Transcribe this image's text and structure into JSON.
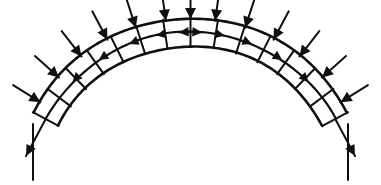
{
  "figure": {
    "title": "Masonry arch with radial loading and line of thrust",
    "type": "structural-diagram",
    "background_color": "#ffffff",
    "ink_color": "#101010",
    "width": 381,
    "height": 185
  },
  "arch": {
    "name": "segmental-masonry-arch",
    "center_x": 190.5,
    "center_y": 196.0,
    "extrados_radius": 178.0,
    "intrados_radius": 150.0,
    "thrust_radius": 164.0,
    "start_angle_deg": 208.0,
    "end_angle_deg": 332.0,
    "voussoir_count": 14,
    "joint_count": 15,
    "description": "Arch ring drawn as three concentric arcs: extrados, line of thrust, intrados."
  },
  "curves": [
    {
      "name": "extrados",
      "label": "outer arch curve",
      "radius": 178.0
    },
    {
      "name": "thrust-line",
      "label": "line of thrust",
      "radius": 164.0
    },
    {
      "name": "intrados",
      "label": "inner arch curve",
      "radius": 150.0
    }
  ],
  "loads": {
    "name": "radial-load-arrows",
    "label": "applied radial loads",
    "count": 13,
    "direction": "inward toward arch centre",
    "shaft_length": 30.0,
    "head_length": 11.0,
    "head_width": 11.0,
    "angles_deg": [
      212,
      222,
      232,
      242,
      252,
      262,
      270,
      278,
      288,
      298,
      308,
      318,
      328
    ]
  },
  "thrust_arrows": {
    "name": "thrust-line-arrows",
    "label": "thrust force arrows along line of thrust",
    "description": "Arrow heads on the line of thrust radiating outward from the crown toward each springing.",
    "left_count": 5,
    "right_count": 5,
    "left_direction": "toward left springing",
    "right_direction": "toward right springing",
    "left_angles_deg": [
      224,
      236,
      248,
      258,
      266
    ],
    "right_angles_deg": [
      274,
      282,
      292,
      304,
      316
    ]
  },
  "reactions": [
    {
      "name": "left-reaction-arrow",
      "label": "left abutment reaction",
      "start_angle_deg": 208,
      "direction": "down and outward to the left",
      "length": 42.0
    },
    {
      "name": "right-reaction-arrow",
      "label": "right abutment reaction",
      "start_angle_deg": 332,
      "direction": "down and outward to the right",
      "length": 42.0
    }
  ],
  "supports": [
    {
      "name": "left-support-column",
      "label": "left pier",
      "x": 33.0,
      "top_y": 124.0,
      "bottom_y": 180.0
    },
    {
      "name": "right-support-column",
      "label": "right pier",
      "x": 348.0,
      "top_y": 124.0,
      "bottom_y": 180.0
    }
  ]
}
